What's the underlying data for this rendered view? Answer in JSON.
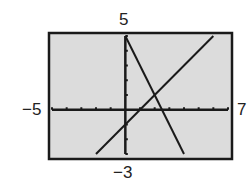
{
  "chart_data": {
    "type": "line",
    "title": "",
    "xlabel": "",
    "ylabel": "",
    "xlim": [
      -5,
      7
    ],
    "ylim": [
      -3,
      5
    ],
    "xtick_step": 1,
    "ytick_step": 1,
    "window_labels": {
      "xmin": "−5",
      "xmax": "7",
      "ymin": "−3",
      "ymax": "5"
    },
    "series": [
      {
        "name": "y = 5 - 2x",
        "x": [
          0,
          4
        ],
        "y": [
          5,
          -3
        ]
      },
      {
        "name": "y = x - 1",
        "x": [
          -2,
          6
        ],
        "y": [
          -3,
          5
        ]
      }
    ],
    "annotations": [
      {
        "label": "intersection",
        "x": 2,
        "y": 1
      }
    ],
    "grid": false,
    "legend": "none"
  },
  "labels": {
    "xmin": "−5",
    "xmax": "7",
    "ymin": "−3",
    "ymax": "5"
  },
  "colors": {
    "screen": "#dcdcdc",
    "frame": "#1a1a1a",
    "line": "#1a1a1a"
  }
}
